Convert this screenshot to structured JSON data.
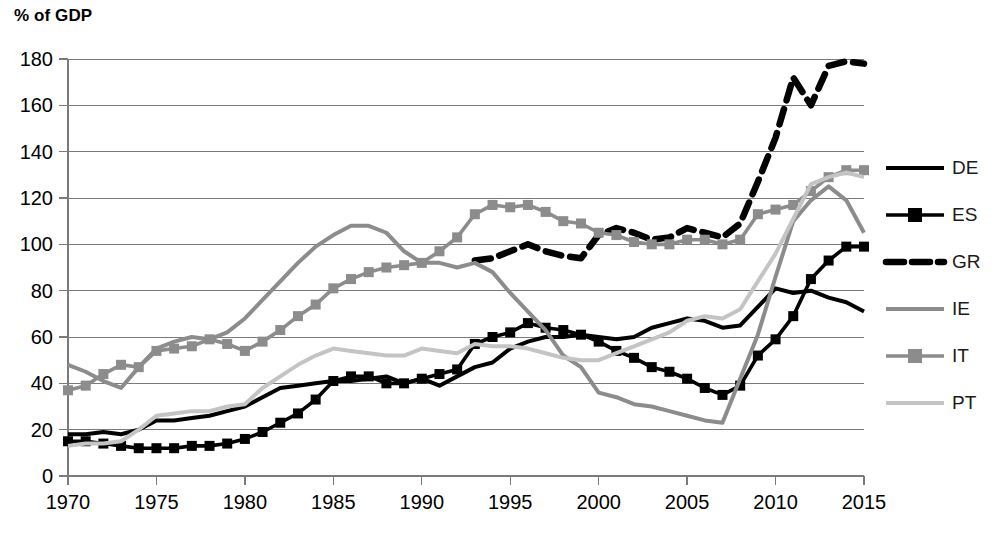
{
  "chart_data": {
    "type": "line",
    "title": "",
    "ylabel": "% of GDP",
    "xlabel": "",
    "ylim": [
      0,
      180
    ],
    "xlim": [
      1970,
      2015
    ],
    "yticks": [
      0,
      20,
      40,
      60,
      80,
      100,
      120,
      140,
      160,
      180
    ],
    "xticks": [
      1970,
      1975,
      1980,
      1985,
      1990,
      1995,
      2000,
      2005,
      2010,
      2015
    ],
    "grid": "horizontal",
    "legend_position": "right",
    "x": [
      1970,
      1971,
      1972,
      1973,
      1974,
      1975,
      1976,
      1977,
      1978,
      1979,
      1980,
      1981,
      1982,
      1983,
      1984,
      1985,
      1986,
      1987,
      1988,
      1989,
      1990,
      1991,
      1992,
      1993,
      1994,
      1995,
      1996,
      1997,
      1998,
      1999,
      2000,
      2001,
      2002,
      2003,
      2004,
      2005,
      2006,
      2007,
      2008,
      2009,
      2010,
      2011,
      2012,
      2013,
      2014,
      2015
    ],
    "series": [
      {
        "name": "DE",
        "style": "solid",
        "color": "#000000",
        "marker": "none",
        "width": 4.0,
        "values": [
          18,
          18,
          19,
          18,
          20,
          24,
          24,
          25,
          26,
          28,
          30,
          34,
          38,
          39,
          40,
          41,
          41,
          42,
          43,
          40,
          42,
          39,
          43,
          47,
          49,
          55,
          58,
          60,
          60,
          61,
          60,
          59,
          60,
          64,
          66,
          68,
          67,
          64,
          65,
          73,
          81,
          79,
          80,
          77,
          75,
          71
        ]
      },
      {
        "name": "ES",
        "style": "solid",
        "color": "#000000",
        "marker": "square",
        "width": 3.6,
        "values": [
          15,
          15,
          14,
          13,
          12,
          12,
          12,
          13,
          13,
          14,
          16,
          19,
          23,
          27,
          33,
          41,
          43,
          43,
          40,
          40,
          42,
          44,
          46,
          57,
          60,
          62,
          66,
          64,
          63,
          61,
          58,
          54,
          51,
          47,
          45,
          42,
          38,
          35,
          39,
          52,
          59,
          69,
          85,
          93,
          99,
          99
        ]
      },
      {
        "name": "GR",
        "style": "dashed",
        "color": "#000000",
        "marker": "none",
        "width": 6.5,
        "values": [
          null,
          null,
          null,
          null,
          null,
          null,
          null,
          null,
          null,
          null,
          null,
          null,
          null,
          null,
          null,
          null,
          null,
          null,
          null,
          null,
          null,
          null,
          null,
          93,
          94,
          97,
          100,
          97,
          95,
          94,
          104,
          107,
          105,
          102,
          103,
          107,
          105,
          103,
          109,
          127,
          146,
          172,
          160,
          177,
          179,
          178
        ]
      },
      {
        "name": "IE",
        "style": "solid",
        "color": "#8c8c8c",
        "marker": "none",
        "width": 4.0,
        "values": [
          48,
          45,
          41,
          38,
          47,
          55,
          58,
          60,
          59,
          62,
          68,
          76,
          84,
          92,
          99,
          104,
          108,
          108,
          105,
          97,
          92,
          92,
          90,
          92,
          88,
          79,
          71,
          63,
          52,
          47,
          36,
          34,
          31,
          30,
          28,
          26,
          24,
          23,
          42,
          61,
          86,
          110,
          119,
          125,
          119,
          105
        ]
      },
      {
        "name": "IT",
        "style": "solid",
        "color": "#8c8c8c",
        "marker": "square",
        "width": 3.6,
        "values": [
          37,
          39,
          44,
          48,
          47,
          54,
          55,
          56,
          59,
          57,
          54,
          58,
          63,
          69,
          74,
          81,
          85,
          88,
          90,
          91,
          92,
          97,
          103,
          113,
          117,
          116,
          117,
          114,
          110,
          109,
          105,
          104,
          101,
          100,
          100,
          102,
          102,
          100,
          102,
          113,
          115,
          117,
          123,
          129,
          132,
          132
        ]
      },
      {
        "name": "PT",
        "style": "solid",
        "color": "#c4c4c4",
        "marker": "none",
        "width": 4.0,
        "values": [
          13,
          14,
          14,
          15,
          20,
          26,
          27,
          28,
          28,
          30,
          31,
          38,
          43,
          48,
          52,
          55,
          54,
          53,
          52,
          52,
          55,
          54,
          53,
          57,
          56,
          56,
          55,
          53,
          51,
          50,
          50,
          53,
          56,
          59,
          62,
          67,
          69,
          68,
          72,
          84,
          96,
          111,
          126,
          129,
          131,
          129
        ]
      }
    ]
  },
  "legend": {
    "items": [
      {
        "label": "DE"
      },
      {
        "label": "ES"
      },
      {
        "label": "GR"
      },
      {
        "label": "IE"
      },
      {
        "label": "IT"
      },
      {
        "label": "PT"
      }
    ]
  }
}
